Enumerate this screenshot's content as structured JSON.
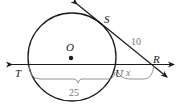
{
  "diagram": {
    "type": "circle-secant-tangent",
    "points": {
      "center": "O",
      "tangent_point": "S",
      "external_point": "R",
      "secant_far": "T",
      "secant_near": "U"
    },
    "measures": {
      "RS": "10",
      "TU": "25",
      "UR": "x"
    },
    "colors": {
      "lines": "#1a1a1a",
      "measure_text": "#777777"
    }
  }
}
